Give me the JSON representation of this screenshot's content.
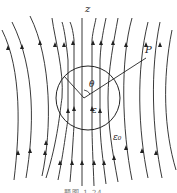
{
  "diagram": {
    "type": "field-lines-dielectric-sphere",
    "labels": {
      "axis": "z",
      "point": "P",
      "angle": "θ",
      "inner_permittivity": "ε",
      "outer_permittivity": "ε₀"
    },
    "caption": "题图 1.24",
    "colors": {
      "line": "#222222",
      "background": "#ffffff"
    }
  }
}
